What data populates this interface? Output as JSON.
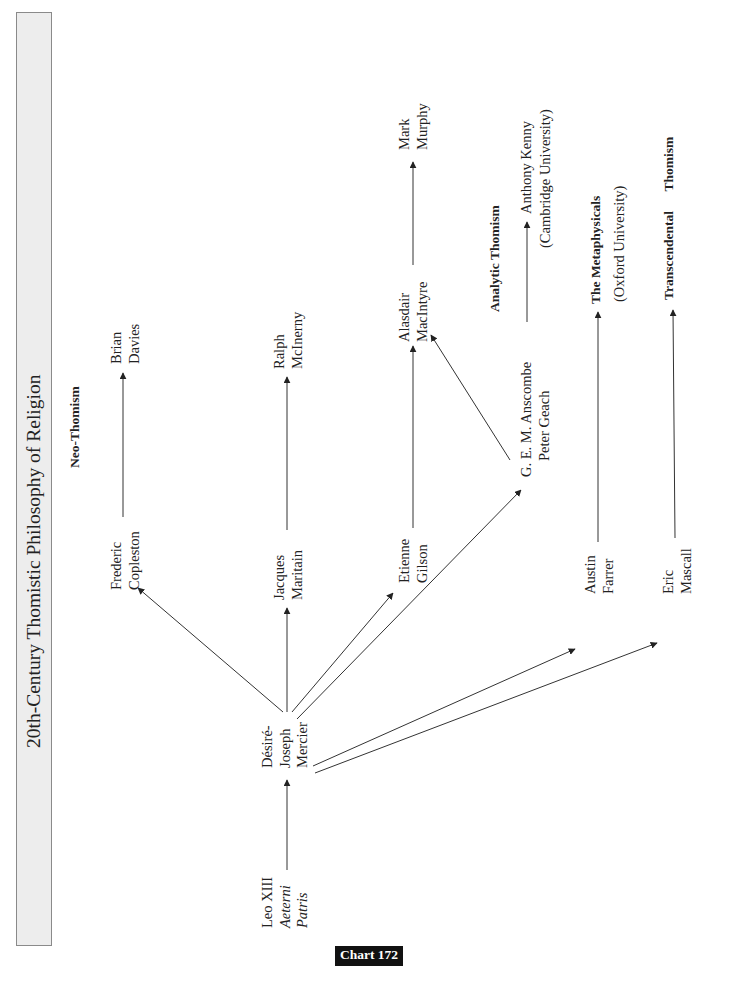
{
  "title": "20th-Century Thomistic Philosophy of Religion",
  "chart_label": "Chart 172",
  "headers": {
    "neo_thomism": "Neo-Thomism",
    "analytic_thomism": "Analytic Thomism",
    "metaphysicals": "The Metaphysicals",
    "metaphysicals_sub": "(Oxford University)",
    "transcendental_1": "Transcendental",
    "transcendental_2": "Thomism"
  },
  "nodes": {
    "leo": {
      "line1": "Leo XIII",
      "line2": "Aeterni",
      "line3": "Patris"
    },
    "mercier": {
      "line1": "Désiré-",
      "line2": "Joseph",
      "line3": "Mercier"
    },
    "copleston": {
      "line1": "Frederic",
      "line2": "Copleston"
    },
    "davies": {
      "line1": "Brian",
      "line2": "Davies"
    },
    "maritain": {
      "line1": "Jacques",
      "line2": "Maritain"
    },
    "mcinerny": {
      "line1": "Ralph",
      "line2": "McInerny"
    },
    "gilson": {
      "line1": "Etienne",
      "line2": "Gilson"
    },
    "macintyre": {
      "line1": "Alasdair",
      "line2": "MacIntyre"
    },
    "murphy": {
      "line1": "Mark",
      "line2": "Murphy"
    },
    "anscombe": {
      "line1": "G. E. M. Anscombe",
      "line2": "Peter Geach"
    },
    "kenny": {
      "line1": "Anthony Kenny",
      "line2": "(Cambridge University)"
    },
    "farrer": {
      "line1": "Austin",
      "line2": "Farrer"
    },
    "mascall": {
      "line1": "Eric",
      "line2": "Mascall"
    }
  },
  "edges": [
    {
      "from": "Leo XIII Aeterni Patris",
      "to": "Désiré-Joseph Mercier"
    },
    {
      "from": "Désiré-Joseph Mercier",
      "to": "Frederic Copleston"
    },
    {
      "from": "Désiré-Joseph Mercier",
      "to": "Jacques Maritain"
    },
    {
      "from": "Désiré-Joseph Mercier",
      "to": "Etienne Gilson"
    },
    {
      "from": "Désiré-Joseph Mercier",
      "to": "G. E. M. Anscombe / Peter Geach"
    },
    {
      "from": "Désiré-Joseph Mercier",
      "to": "Austin Farrer"
    },
    {
      "from": "Désiré-Joseph Mercier",
      "to": "Eric Mascall"
    },
    {
      "from": "Frederic Copleston",
      "to": "Brian Davies"
    },
    {
      "from": "Jacques Maritain",
      "to": "Ralph McInerny"
    },
    {
      "from": "Etienne Gilson",
      "to": "Alasdair MacIntyre"
    },
    {
      "from": "G. E. M. Anscombe / Peter Geach",
      "to": "Alasdair MacIntyre"
    },
    {
      "from": "Alasdair MacIntyre",
      "to": "Mark Murphy"
    },
    {
      "from": "G. E. M. Anscombe / Peter Geach",
      "to": "Anthony Kenny (Cambridge University)"
    },
    {
      "from": "Austin Farrer",
      "to": "The Metaphysicals (Oxford University)"
    },
    {
      "from": "Eric Mascall",
      "to": "Transcendental Thomism"
    }
  ],
  "colors": {
    "title_box_bg": "#ededed",
    "title_box_border": "#8a8a8a",
    "line": "#333333",
    "chart_label_bg": "#111111",
    "chart_label_fg": "#ffffff"
  }
}
